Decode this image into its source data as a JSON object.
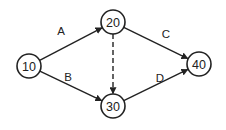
{
  "diagram": {
    "type": "activity-network",
    "nodes": [
      {
        "id": "n10",
        "label": "10",
        "cx": 29,
        "cy": 66,
        "r": 12
      },
      {
        "id": "n20",
        "label": "20",
        "cx": 113,
        "cy": 22,
        "r": 12
      },
      {
        "id": "n30",
        "label": "30",
        "cx": 113,
        "cy": 106,
        "r": 12
      },
      {
        "id": "n40",
        "label": "40",
        "cx": 199,
        "cy": 64,
        "r": 12
      }
    ],
    "edges": [
      {
        "id": "A",
        "label": "A",
        "from": "n10",
        "to": "n20",
        "style": "solid",
        "lx": 61,
        "ly": 31
      },
      {
        "id": "B",
        "label": "B",
        "from": "n10",
        "to": "n30",
        "style": "solid",
        "lx": 68,
        "ly": 77
      },
      {
        "id": "C",
        "label": "C",
        "from": "n20",
        "to": "n40",
        "style": "solid",
        "lx": 166,
        "ly": 34
      },
      {
        "id": "D",
        "label": "D",
        "from": "n30",
        "to": "n40",
        "style": "solid",
        "lx": 160,
        "ly": 78
      },
      {
        "id": "dummy",
        "label": "",
        "from": "n20",
        "to": "n30",
        "style": "dashed"
      }
    ],
    "colors": {
      "stroke": "#222222",
      "background": "#ffffff"
    }
  }
}
